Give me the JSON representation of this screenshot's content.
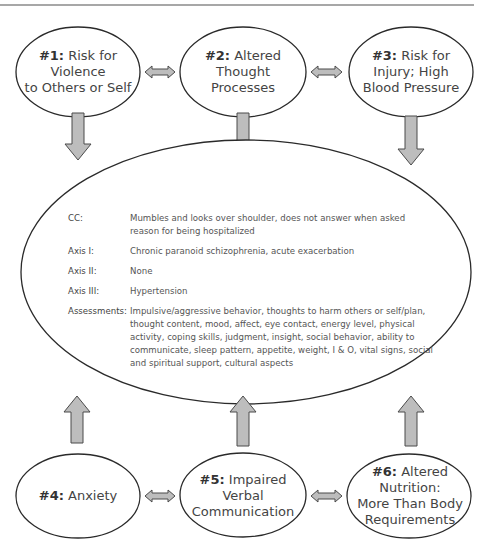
{
  "diagram": {
    "type": "concept-map",
    "colors": {
      "line": "#2a2a2a",
      "arrow_fill": "#bdbdbd",
      "arrow_stroke": "#4a4a4a",
      "header_rule": "#8a8a8a"
    },
    "nodes_top": [
      {
        "id": "n1",
        "num": "#1:",
        "text": "Risk for Violence to Others or Self",
        "line1": "Risk for Violence",
        "line2": "to Others or Self"
      },
      {
        "id": "n2",
        "num": "#2:",
        "text": "Altered Thought Processes",
        "line1": "Altered",
        "line2": "Thought Processes"
      },
      {
        "id": "n3",
        "num": "#3:",
        "text": "Risk for Injury; High Blood Pressure",
        "line1": "Risk for",
        "line2": "Injury; High",
        "line3": "Blood Pressure"
      }
    ],
    "nodes_bottom": [
      {
        "id": "n4",
        "num": "#4:",
        "text": "Anxiety",
        "line1": "Anxiety"
      },
      {
        "id": "n5",
        "num": "#5:",
        "text": "Impaired Verbal Communication",
        "line1": "Impaired",
        "line2": "Verbal",
        "line3": "Communication"
      },
      {
        "id": "n6",
        "num": "#6:",
        "text": "Altered Nutrition: More Than Body Requirements",
        "line1": "Altered Nutrition:",
        "line2": "More Than Body",
        "line3": "Requirements"
      }
    ],
    "center": {
      "rows": [
        {
          "key": "CC:",
          "value": "Mumbles and looks over shoulder, does not answer when asked reason for being hospitalized"
        },
        {
          "key": "Axis I:",
          "value": "Chronic paranoid schizophrenia, acute exacerbation"
        },
        {
          "key": "Axis II:",
          "value": "None"
        },
        {
          "key": "Axis III:",
          "value": "Hypertension"
        },
        {
          "key": "Assessments:",
          "value": "Impulsive/aggressive behavior, thoughts to harm others or self/plan, thought content, mood, affect, eye contact, energy level, physical activity, coping skills, judgment, insight, social behavior, ability to communicate, sleep pattern, appetite, weight, I & O, vital signs, social and spiritual support, cultural aspects"
        }
      ]
    },
    "edges": [
      {
        "from": "n1",
        "to": "n2",
        "type": "bidirectional"
      },
      {
        "from": "n2",
        "to": "n3",
        "type": "bidirectional"
      },
      {
        "from": "n4",
        "to": "n5",
        "type": "bidirectional"
      },
      {
        "from": "n5",
        "to": "n6",
        "type": "bidirectional"
      },
      {
        "from": "n1",
        "to": "center",
        "type": "arrow-down"
      },
      {
        "from": "n2",
        "to": "center",
        "type": "arrow-down"
      },
      {
        "from": "n3",
        "to": "center",
        "type": "arrow-down"
      },
      {
        "from": "n4",
        "to": "center",
        "type": "arrow-up"
      },
      {
        "from": "n5",
        "to": "center",
        "type": "arrow-up"
      },
      {
        "from": "n6",
        "to": "center",
        "type": "arrow-up"
      }
    ]
  }
}
